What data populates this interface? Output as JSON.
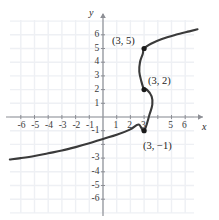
{
  "figure": {
    "kind": "cartesian-graph",
    "background": "#ffffff",
    "grid_color": "#eef0f4",
    "axis_color": "#8d8f95",
    "curve_color": "#3a3a3a",
    "point_color": "#1a1a1a"
  },
  "axes": {
    "x_label": "x",
    "y_label": "y",
    "x_ticks": [
      "-6",
      "-5",
      "-4",
      "-3",
      "-2",
      "-1",
      "1",
      "2",
      "3",
      "5",
      "6"
    ],
    "y_ticks": [
      "6",
      "5",
      "4",
      "3",
      "2",
      "1",
      "-1",
      "-3",
      "-4",
      "-5",
      "-6"
    ],
    "xlim": [
      -6.8,
      7.0
    ],
    "ylim": [
      -7.0,
      7.2
    ]
  },
  "chart_data": {
    "type": "line",
    "title": "",
    "xlabel": "x",
    "ylabel": "y",
    "grid": true,
    "legend": null,
    "xlim": [
      -6.8,
      7.0
    ],
    "ylim": [
      -7.0,
      7.2
    ],
    "xticks": [
      -6,
      -5,
      -4,
      -3,
      -2,
      -1,
      1,
      2,
      3,
      5,
      6
    ],
    "yticks": [
      6,
      5,
      4,
      3,
      2,
      1,
      -1,
      -3,
      -4,
      -5,
      -6
    ],
    "series": [
      {
        "name": "relation",
        "description": "sideways S-shaped cubic relation; x expressed as a function of y, failing the vertical line test",
        "points": [
          [
            -6.8,
            -3.1
          ],
          [
            -6.0,
            -3.0
          ],
          [
            -5.0,
            -2.85
          ],
          [
            -4.0,
            -2.65
          ],
          [
            -3.0,
            -2.45
          ],
          [
            -2.0,
            -2.2
          ],
          [
            -1.0,
            -1.92
          ],
          [
            0.0,
            -1.6
          ],
          [
            1.0,
            -1.3
          ],
          [
            2.0,
            -0.9
          ],
          [
            2.6,
            -0.55
          ],
          [
            3.0,
            -1.0
          ],
          [
            3.4,
            0.2
          ],
          [
            3.6,
            0.9
          ],
          [
            3.55,
            1.5
          ],
          [
            3.2,
            2.0
          ],
          [
            3.0,
            2.0
          ],
          [
            2.8,
            2.6
          ],
          [
            2.65,
            3.3
          ],
          [
            2.7,
            4.0
          ],
          [
            2.9,
            4.6
          ],
          [
            3.0,
            5.0
          ],
          [
            3.5,
            5.35
          ],
          [
            4.3,
            5.7
          ],
          [
            5.3,
            6.0
          ],
          [
            6.3,
            6.25
          ],
          [
            6.9,
            6.4
          ]
        ]
      }
    ],
    "annotated_points": [
      {
        "id": "p1",
        "label": "(3, 5)",
        "x": 3,
        "y": 5,
        "label_pos": "upper-left"
      },
      {
        "id": "p2",
        "label": "(3, 2)",
        "x": 3,
        "y": 2,
        "label_pos": "right"
      },
      {
        "id": "p3",
        "label": "(3, −1)",
        "x": 3,
        "y": -1,
        "label_pos": "lower-right"
      }
    ]
  }
}
